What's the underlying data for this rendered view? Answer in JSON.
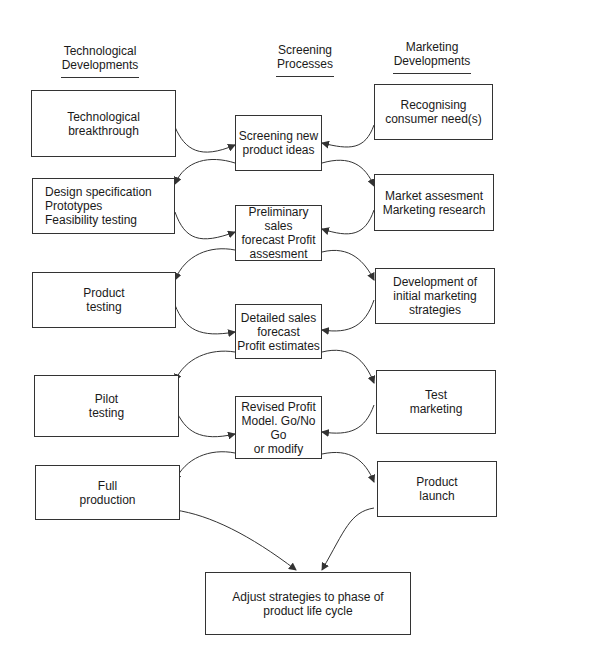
{
  "columns": {
    "left": {
      "header": "Technological\nDevelopments"
    },
    "center": {
      "header": "Screening\nProcesses"
    },
    "right": {
      "header": "Marketing\nDevelopments"
    }
  },
  "technological": [
    "Technological\nbreakthrough",
    "Design specification\nPrototypes\nFeasibility testing",
    "Product\ntesting",
    "Pilot\ntesting",
    "Full\nproduction"
  ],
  "screening": [
    "Screening new\nproduct ideas",
    "Preliminary sales\nforecast Profit\nassesment",
    "Detailed sales\nforecast\nProfit estimates",
    "Revised Profit\nModel. Go/No Go\nor modify"
  ],
  "marketing": [
    "Recognising\nconsumer need(s)",
    "Market assesment\nMarketing research",
    "Development of\ninitial marketing\nstrategies",
    "Test\nmarketing",
    "Product\nlaunch"
  ],
  "final": "Adjust strategies to phase of\nproduct life cycle",
  "colors": {
    "line": "#333333",
    "text": "#1a1a1a",
    "background": "#ffffff"
  }
}
